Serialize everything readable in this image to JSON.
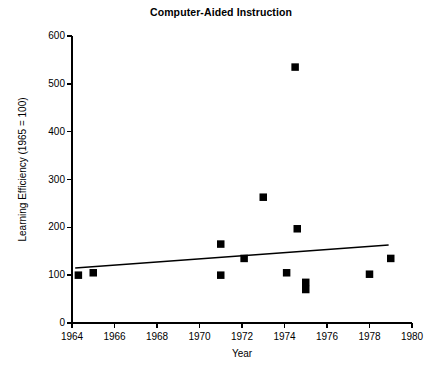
{
  "chart_data": {
    "type": "scatter",
    "title": "Computer-Aided Instruction",
    "xlabel": "Year",
    "ylabel": "Learning Efficiency (1965 = 100)",
    "xlim": [
      1964,
      1980
    ],
    "ylim": [
      0,
      600
    ],
    "xticks": [
      1964,
      1966,
      1968,
      1970,
      1972,
      1974,
      1976,
      1978,
      1980
    ],
    "xtick_labels": [
      "1964",
      "1966",
      "1968",
      "1970",
      "1972",
      "1974",
      "1976",
      "1978",
      "1980"
    ],
    "yticks": [
      0,
      100,
      200,
      300,
      400,
      500,
      600
    ],
    "ytick_labels": [
      "0",
      "100",
      "200",
      "300",
      "400",
      "500",
      "600"
    ],
    "grid": false,
    "legend": null,
    "marker": "square",
    "marker_color": "#000000",
    "points": [
      {
        "x": 1964.3,
        "y": 100
      },
      {
        "x": 1965.0,
        "y": 105
      },
      {
        "x": 1971.0,
        "y": 165
      },
      {
        "x": 1971.0,
        "y": 100
      },
      {
        "x": 1972.1,
        "y": 135
      },
      {
        "x": 1973.0,
        "y": 263
      },
      {
        "x": 1974.5,
        "y": 535
      },
      {
        "x": 1974.6,
        "y": 197
      },
      {
        "x": 1974.1,
        "y": 105
      },
      {
        "x": 1975.0,
        "y": 85
      },
      {
        "x": 1975.0,
        "y": 70
      },
      {
        "x": 1978.0,
        "y": 102
      },
      {
        "x": 1979.0,
        "y": 135
      }
    ],
    "trendline": {
      "x_start": 1964.15,
      "y_start": 115,
      "x_end": 1978.9,
      "y_end": 163,
      "color": "#000000"
    }
  }
}
